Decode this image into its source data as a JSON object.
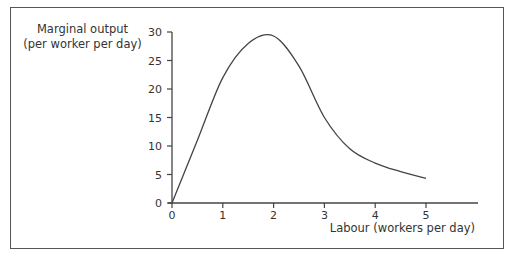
{
  "chart_data": {
    "type": "line",
    "title": "",
    "xlabel": "Labour (workers per day)",
    "ylabel_line1": "Marginal output",
    "ylabel_line2": "(per worker per day)",
    "x_ticks": [
      "0",
      "1",
      "2",
      "3",
      "4",
      "5"
    ],
    "y_ticks": [
      "0",
      "5",
      "10",
      "15",
      "20",
      "25",
      "30"
    ],
    "xlim": [
      0,
      6
    ],
    "ylim": [
      0,
      30
    ],
    "grid": false,
    "legend": null,
    "series": [
      {
        "name": "Marginal output",
        "x": [
          0,
          0.5,
          1,
          1.5,
          2,
          2.5,
          3,
          3.5,
          4,
          4.5,
          5
        ],
        "y": [
          0,
          11,
          22,
          28,
          29.3,
          24,
          15,
          9.5,
          7,
          5.5,
          4.3
        ]
      }
    ]
  }
}
